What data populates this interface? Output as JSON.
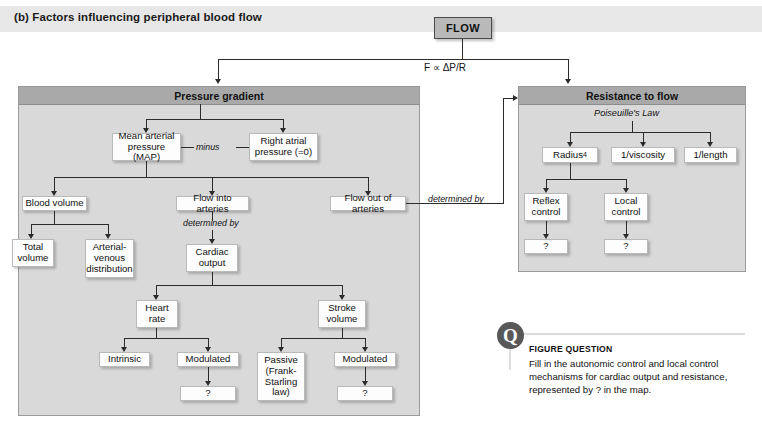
{
  "caption": {
    "label": "(b) Factors influencing peripheral blood flow"
  },
  "flow": {
    "label": "FLOW",
    "equation": "F ∝  ΔP/R"
  },
  "panels": {
    "pressure": {
      "title": "Pressure gradient"
    },
    "resistance": {
      "title": "Resistance to flow",
      "law": "Poiseuille's Law"
    }
  },
  "edge_labels": {
    "minus": "minus",
    "determined_by_cardiac": "determined by",
    "determined_by_resistance": "determined by"
  },
  "nodes": {
    "map": "Mean arterial pressure (MAP)",
    "right_atrial": "Right atrial pressure (=0)",
    "blood_volume": "Blood volume",
    "flow_into": "Flow into arteries",
    "flow_out": "Flow out of arteries",
    "total_volume": "Total volume",
    "av_distribution": "Arterial-venous distribution",
    "cardiac_output": "Cardiac output",
    "heart_rate": "Heart rate",
    "stroke_volume": "Stroke volume",
    "intrinsic": "Intrinsic",
    "modulated_hr": "Modulated",
    "passive": "Passive (Frank-Starling law)",
    "modulated_sv": "Modulated",
    "q_hr": "?",
    "q_sv": "?",
    "radius": "Radius",
    "radius_exponent": "4",
    "viscosity": "1/viscosity",
    "length": "1/length",
    "reflex_control": "Reflex control",
    "local_control": "Local control",
    "q_reflex": "?",
    "q_local": "?"
  },
  "figure_question": {
    "icon": "Q",
    "title": "FIGURE QUESTION",
    "body": "Fill in the autonomic control and local control mechanisms for cardiac output and resistance, represented by ? in the map."
  },
  "colors": {
    "panel_body": "#d9d9d9",
    "panel_header": "#a9a9a9",
    "caption_strip": "#e7e7e7",
    "node_fill": "#fdfdfd",
    "flow_fill": "#b9b9b9",
    "connector": "#2b2b2b",
    "q_circle": "#585858"
  }
}
